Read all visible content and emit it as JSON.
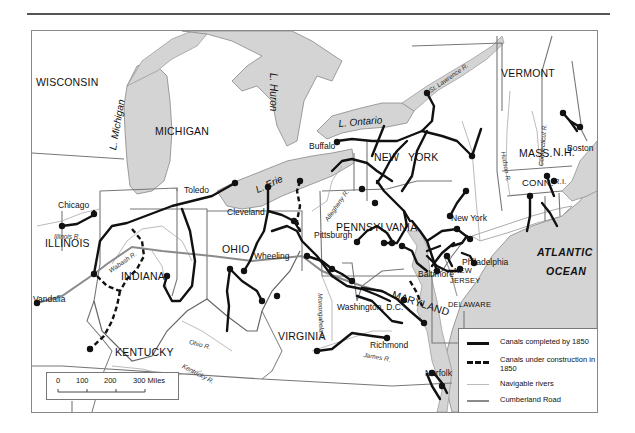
{
  "map": {
    "title": "",
    "regions": {
      "states": [
        "WISCONSIN",
        "MICHIGAN",
        "ILLINOIS",
        "INDIANA",
        "OHIO",
        "KENTUCKY",
        "VIRGINIA",
        "PENNSYLVANIA",
        "NEW YORK",
        "VERMONT",
        "N.H.",
        "MAINE",
        "MASS.",
        "CONN.",
        "R.I.",
        "NEW JERSEY",
        "DELAWARE",
        "MARYLAND"
      ],
      "new_line_1": "NEW",
      "new_line_2": "YORK",
      "nj_line_1": "NEW",
      "nj_line_2": "JERSEY"
    },
    "water": {
      "lake_michigan": "L. Michigan",
      "lake_huron": "L. Huron",
      "lake_erie": "L. Erie",
      "lake_ontario": "L. Ontario",
      "atlantic_1": "ATLANTIC",
      "atlantic_2": "OCEAN"
    },
    "rivers": {
      "st_lawrence": "St. Lawrence R.",
      "connecticut": "Connecticut R.",
      "hudson": "Hudson R.",
      "allegheny": "Allegheny R.",
      "illinois": "Illinois R.",
      "wabash": "Wabash R.",
      "ohio": "Ohio R.",
      "kentucky": "Kentucky R.",
      "green": "Green R.",
      "monongahela": "Monongahela R.",
      "james": "James R."
    },
    "cities": {
      "chicago": "Chicago",
      "toledo": "Toledo",
      "cleveland": "Cleveland",
      "buffalo": "Buffalo",
      "pittsburgh": "Pittsburgh",
      "wheeling": "Wheeling",
      "vandalia": "Vandalia",
      "boston": "Boston",
      "new_york": "New York",
      "philadelphia": "Philadelphia",
      "baltimore": "Baltimore",
      "washington": "Washington, D.C.",
      "richmond": "Richmond",
      "norfolk": "Norfolk"
    },
    "legend": {
      "items": [
        {
          "label": "Canals completed by 1850",
          "style": "solid-black"
        },
        {
          "label": "Canals under construction in 1850",
          "style": "dashed-black"
        },
        {
          "label": "Navigable rivers",
          "style": "thin-light-gray"
        },
        {
          "label": "Cumberland Road",
          "style": "medium-gray"
        }
      ]
    },
    "scale_bar": {
      "ticks": [
        "0",
        "100",
        "200",
        "300 Miles"
      ]
    },
    "colors": {
      "water": "#d4d4d4",
      "canal": "#111111",
      "border": "#777777",
      "river": "#aaaaaa",
      "road": "#8a8a8a"
    }
  }
}
